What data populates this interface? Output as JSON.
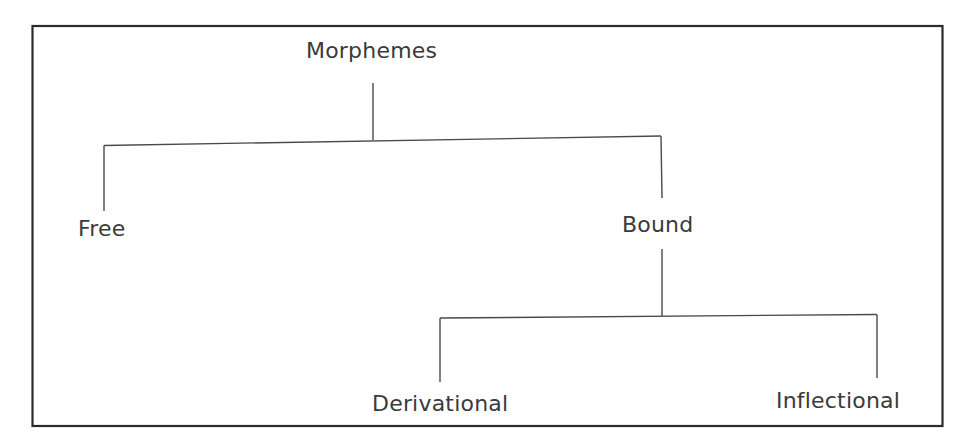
{
  "diagram": {
    "type": "tree",
    "title": "Morphemes",
    "colors": {
      "frame": "#2b2b2b",
      "line": "#4a4a4a",
      "text": "#3a3a3a",
      "background": "#ffffff"
    },
    "nodes": {
      "root": {
        "label": "Morphemes"
      },
      "free": {
        "label": "Free"
      },
      "bound": {
        "label": "Bound"
      },
      "derivational": {
        "label": "Derivational"
      },
      "inflectional": {
        "label": "Inflectional"
      }
    },
    "edges": [
      {
        "from": "Morphemes",
        "to": "Free"
      },
      {
        "from": "Morphemes",
        "to": "Bound"
      },
      {
        "from": "Bound",
        "to": "Derivational"
      },
      {
        "from": "Bound",
        "to": "Inflectional"
      }
    ]
  }
}
